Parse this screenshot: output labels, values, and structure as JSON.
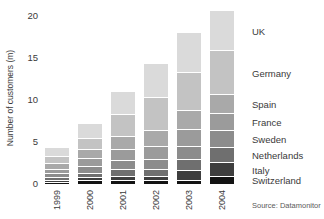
{
  "chart_data": {
    "type": "bar",
    "stacked": true,
    "title": "",
    "xlabel": "",
    "ylabel": "Number of customers (m)",
    "ylim": [
      0,
      20
    ],
    "yticks": [
      0,
      5,
      10,
      15,
      20
    ],
    "grid": false,
    "legend_position": "right",
    "categories": [
      "1999",
      "2000",
      "2001",
      "2002",
      "2003",
      "2004"
    ],
    "series": [
      {
        "name": "Switzerland",
        "color": "#131313",
        "values": [
          0.15,
          0.3,
          0.3,
          0.3,
          0.4,
          0.8
        ]
      },
      {
        "name": "Italy",
        "color": "#3e3e3e",
        "values": [
          0.25,
          0.4,
          0.55,
          0.55,
          1.2,
          1.7
        ]
      },
      {
        "name": "Netherlands",
        "color": "#6f6f6f",
        "values": [
          0.3,
          0.5,
          0.8,
          0.8,
          1.3,
          1.8
        ]
      },
      {
        "name": "Sweden",
        "color": "#8c8c8c",
        "values": [
          0.45,
          0.85,
          1.1,
          1.2,
          1.5,
          2.0
        ]
      },
      {
        "name": "France",
        "color": "#9b9b9b",
        "values": [
          0.55,
          0.9,
          1.25,
          1.55,
          2.0,
          2.0
        ]
      },
      {
        "name": "Spain",
        "color": "#a9a9a9",
        "values": [
          0.65,
          1.15,
          1.6,
          1.9,
          2.3,
          2.3
        ]
      },
      {
        "name": "Germany",
        "color": "#c3c3c3",
        "values": [
          0.9,
          1.25,
          2.6,
          4.0,
          4.5,
          5.2
        ]
      },
      {
        "name": "UK",
        "color": "#dadada",
        "values": [
          1.1,
          1.75,
          2.7,
          4.0,
          4.8,
          4.8
        ]
      }
    ],
    "totals": [
      4.35,
      7.1,
      10.9,
      14.3,
      18.0,
      20.6
    ],
    "source": "Source: Datamonitor"
  }
}
